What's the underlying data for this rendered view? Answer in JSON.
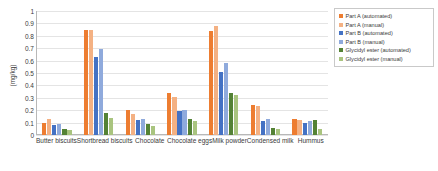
{
  "chart_data": {
    "type": "bar",
    "title": "",
    "xlabel": "",
    "ylabel": "(mg/kg)",
    "ylim": [
      0,
      1
    ],
    "grid": true,
    "legend_position": "right",
    "categories": [
      "Butter biscuits",
      "Shortbread biscuits",
      "Chocolate",
      "Chocolate eggs",
      "Milk powder",
      "Condensed milk",
      "Hummus"
    ],
    "yticks": [
      "0",
      "0.1",
      "0.2",
      "0.3",
      "0.4",
      "0.5",
      "0.6",
      "0.7",
      "0.8",
      "0.9",
      "1"
    ],
    "ytick_values": [
      0,
      0.1,
      0.2,
      0.3,
      0.4,
      0.5,
      0.6,
      0.7,
      0.8,
      0.9,
      1
    ],
    "series": [
      {
        "name": "Part A (automated)",
        "color": "#ED7D31",
        "values": [
          0.1,
          0.85,
          0.2,
          0.34,
          0.84,
          0.24,
          0.13
        ]
      },
      {
        "name": "Part A (manual)",
        "color": "#F4B183",
        "values": [
          0.13,
          0.85,
          0.17,
          0.31,
          0.88,
          0.23,
          0.12
        ]
      },
      {
        "name": "Part B (automated)",
        "color": "#4472C4",
        "values": [
          0.08,
          0.63,
          0.12,
          0.19,
          0.51,
          0.11,
          0.1
        ]
      },
      {
        "name": "Part B (manual)",
        "color": "#8FAADC",
        "values": [
          0.09,
          0.69,
          0.13,
          0.2,
          0.58,
          0.13,
          0.11
        ]
      },
      {
        "name": "Glycidyl ester (automated)",
        "color": "#548235",
        "values": [
          0.05,
          0.18,
          0.09,
          0.13,
          0.34,
          0.06,
          0.12
        ]
      },
      {
        "name": "Glycidyl ester (manual)",
        "color": "#A9C47F",
        "values": [
          0.04,
          0.14,
          0.07,
          0.11,
          0.32,
          0.05,
          0.05
        ]
      }
    ]
  }
}
